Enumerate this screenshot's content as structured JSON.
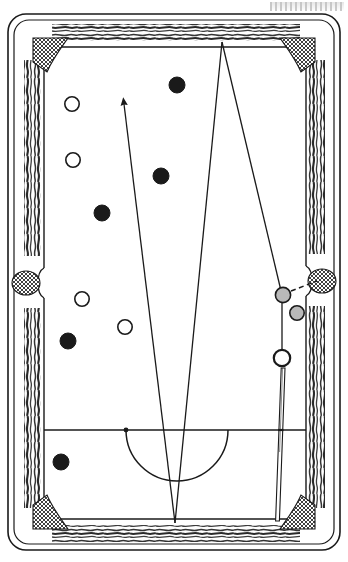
{
  "figure": {
    "width": 348,
    "height": 562
  },
  "colors": {
    "ink": "#1a1a1a",
    "rail_wood": "#3d3d3d",
    "cloth": "#ffffff",
    "ball_solid": "#1a1a1a",
    "ball_hollow": "#ffffff",
    "ball_shaded": "#b9b9b9",
    "pocket_mesh": "#2b2b2b",
    "line": "#1a1a1a"
  },
  "table": {
    "outer": {
      "x": 8,
      "y": 14,
      "width": 332,
      "height": 536,
      "radius": 18
    },
    "rail_band": {
      "inset": 10,
      "radius": 14
    },
    "cushion": {
      "x": 44,
      "y": 48,
      "width": 262,
      "height": 470
    },
    "playfield_label": "cloth"
  },
  "pockets": [
    {
      "name": "pocket-top-left",
      "x": 47,
      "y": 50,
      "r": 15,
      "type": "corner"
    },
    {
      "name": "pocket-top-right",
      "x": 303,
      "y": 50,
      "r": 15,
      "type": "corner"
    },
    {
      "name": "pocket-side-left",
      "x": 26,
      "y": 283,
      "r": 14,
      "type": "side"
    },
    {
      "name": "pocket-side-right",
      "x": 322,
      "y": 281,
      "r": 14,
      "type": "side"
    },
    {
      "name": "pocket-bottom-left",
      "x": 47,
      "y": 517,
      "r": 15,
      "type": "corner"
    },
    {
      "name": "pocket-bottom-right",
      "x": 303,
      "y": 517,
      "r": 15,
      "type": "corner"
    }
  ],
  "head_string": {
    "name": "head-string-line",
    "x1": 44,
    "y1": 430,
    "x2": 306,
    "y2": 430,
    "head_spot": {
      "x": 126,
      "y": 430,
      "r": 2.4
    }
  },
  "kitchen_arc": {
    "name": "kitchen-semicircle",
    "center_x": 177,
    "center_y": 430,
    "radius": 51,
    "label": "D / kitchen"
  },
  "balls": [
    {
      "id": "ball-1",
      "x": 177,
      "y": 85,
      "r": 8.0,
      "fill": "solid",
      "label": "object ball"
    },
    {
      "id": "ball-2",
      "x": 72,
      "y": 104,
      "r": 7.2,
      "fill": "hollow",
      "label": "object ball"
    },
    {
      "id": "ball-3",
      "x": 73,
      "y": 160,
      "r": 7.2,
      "fill": "hollow",
      "label": "object ball"
    },
    {
      "id": "ball-4",
      "x": 161,
      "y": 176,
      "r": 8.0,
      "fill": "solid",
      "label": "object ball"
    },
    {
      "id": "ball-5",
      "x": 102,
      "y": 213,
      "r": 8.0,
      "fill": "solid",
      "label": "object ball"
    },
    {
      "id": "ball-6",
      "x": 82,
      "y": 299,
      "r": 7.2,
      "fill": "hollow",
      "label": "object ball"
    },
    {
      "id": "ball-7",
      "x": 125,
      "y": 327,
      "r": 7.2,
      "fill": "hollow",
      "label": "object ball"
    },
    {
      "id": "ball-8",
      "x": 68,
      "y": 341,
      "r": 8.0,
      "fill": "solid",
      "label": "object ball"
    },
    {
      "id": "ball-9",
      "x": 61,
      "y": 462,
      "r": 8.0,
      "fill": "solid",
      "label": "object ball"
    },
    {
      "id": "ball-10",
      "x": 283,
      "y": 295,
      "r": 7.6,
      "fill": "shaded",
      "label": "target ball near right side pocket"
    },
    {
      "id": "ball-11",
      "x": 297,
      "y": 313,
      "r": 7.2,
      "fill": "shaded",
      "label": "object ball"
    }
  ],
  "cue_ball": {
    "id": "cue-ball",
    "x": 282,
    "y": 358,
    "r": 8.2,
    "fill": "hollow",
    "label": "cue ball"
  },
  "cue_stick": {
    "name": "cue-stick",
    "tip_x": 282,
    "tip_y": 368,
    "butt_x": 277,
    "butt_y": 520,
    "width": 4,
    "label": "cue stick aimed at cue ball"
  },
  "aim_lines": [
    {
      "name": "aim-line-arrow",
      "points": "175,523 124,104",
      "arrow": true,
      "arrow_tip": {
        "x": 124,
        "y": 104
      },
      "label": "primary aim line with arrowhead"
    },
    {
      "name": "aim-line-left-leg",
      "points": "175,523 222,42",
      "arrow": false,
      "label": "cut angle line rising to top rail"
    },
    {
      "name": "aim-line-right-leg",
      "points": "222,42 282,295",
      "arrow": false,
      "label": "line from top rail down to target ball"
    },
    {
      "name": "aim-line-cue-to-target",
      "points": "282,295 282,358",
      "arrow": false,
      "label": "line from cue ball up to target ball"
    }
  ],
  "dashed_line": {
    "name": "pocket-dashed-line",
    "x1": 291,
    "y1": 291,
    "x2": 317,
    "y2": 281,
    "label": "dashed path from target ball into right side pocket"
  },
  "annotations": {
    "top_right_smudge": "scan artifact"
  }
}
